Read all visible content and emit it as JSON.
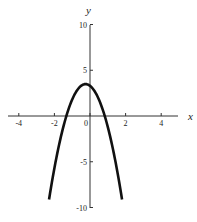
{
  "chart_data": {
    "type": "line",
    "title": "",
    "xlabel": "x",
    "ylabel": "y",
    "xlim": [
      -5,
      5
    ],
    "ylim": [
      -10,
      10
    ],
    "grid": false,
    "legend": null,
    "x_ticks": [
      -4,
      -2,
      0,
      2,
      4
    ],
    "x_tick_labels": [
      "-4",
      "-2",
      "0",
      "2",
      "4"
    ],
    "y_ticks": [
      -10,
      -5,
      5,
      10
    ],
    "y_tick_labels": [
      "-10",
      "-5",
      "5",
      "10"
    ],
    "series": [
      {
        "name": "parabola",
        "description": "Downward-opening parabola, vertex near (-0.25, 3.5), x-intercepts near -1.33 and 0.83",
        "equation_estimate": "y = -3x^2 - 1.5x + 3.3",
        "x": [
          -2.3,
          -2.0,
          -1.5,
          -1.33,
          -1.0,
          -0.5,
          -0.25,
          0.0,
          0.5,
          0.83,
          1.0,
          1.5,
          1.8
        ],
        "y": [
          -9.1,
          -5.7,
          -1.2,
          0.0,
          1.8,
          3.3,
          3.5,
          3.3,
          1.8,
          0.0,
          -1.2,
          -5.7,
          -9.1
        ],
        "color": "#111111"
      }
    ]
  }
}
